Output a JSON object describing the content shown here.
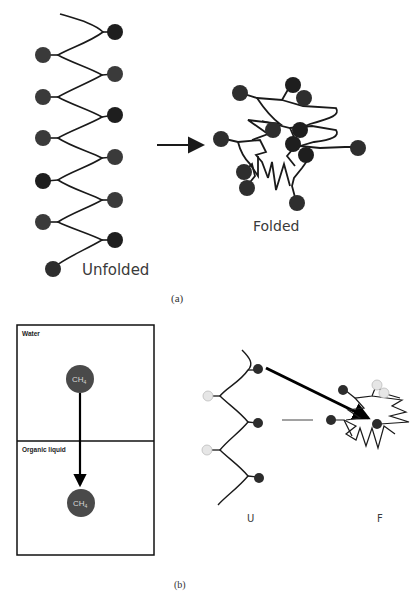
{
  "panel_a": {
    "caption": "(a)",
    "unfolded_label": "Unfolded",
    "folded_label": "Folded",
    "colors": {
      "bead": "#3a3a3a",
      "bead_dark": "#1e1e1e",
      "line": "#1a1a1a"
    }
  },
  "panel_b": {
    "caption": "(b)",
    "box": {
      "top_label": "Water",
      "bottom_label": "Organic liquid",
      "molecule_top": "CH",
      "molecule_top_sub": "4",
      "molecule_bottom": "CH",
      "molecule_bottom_sub": "4"
    },
    "unfolded_label": "U",
    "folded_label": "F",
    "colors": {
      "bead_dark": "#2c2c2c",
      "bead_light": "#e6e6e6",
      "molecule": "#4a4a4a"
    }
  }
}
